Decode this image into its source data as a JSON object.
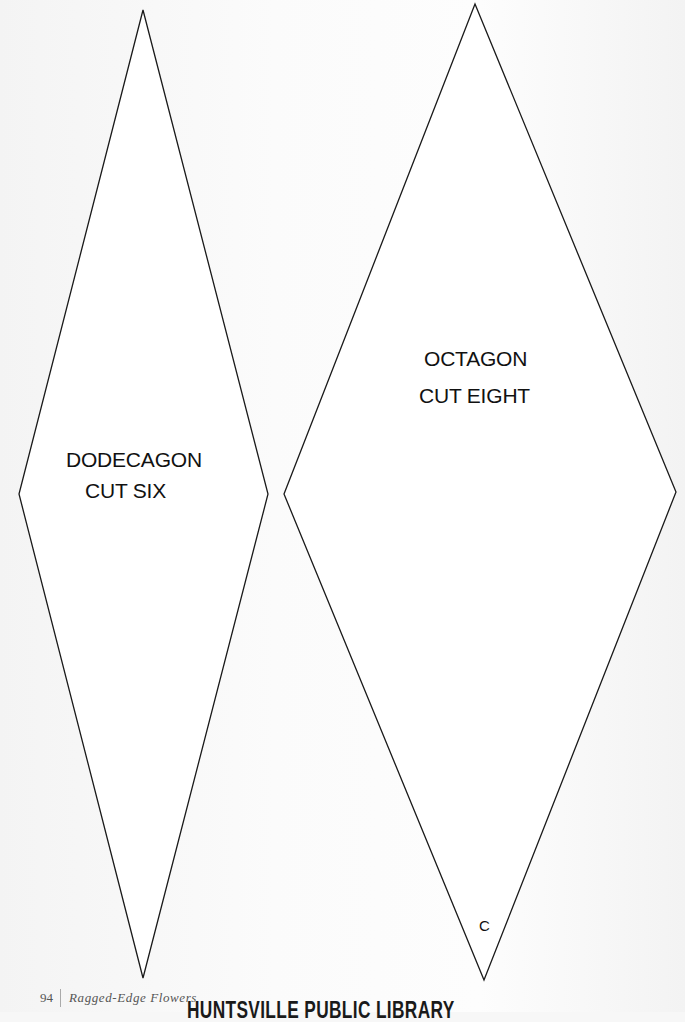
{
  "page": {
    "shapes": [
      {
        "id": "dodecagon",
        "points": {
          "top": [
            143,
            10
          ],
          "right": [
            268,
            494
          ],
          "bottom": [
            143,
            978
          ],
          "left": [
            19,
            494
          ]
        },
        "label_lines": [
          "DODECAGON",
          "CUT SIX"
        ]
      },
      {
        "id": "octagon",
        "points": {
          "top": [
            475,
            4
          ],
          "right": [
            676,
            492
          ],
          "bottom": [
            484,
            980
          ],
          "left": [
            284,
            494
          ]
        },
        "label_lines": [
          "OCTAGON",
          "CUT EIGHT"
        ],
        "corner_mark": "C"
      }
    ],
    "footer": {
      "page_number": "94",
      "book_title": "Ragged-Edge Flowers"
    },
    "stamp": "HUNTSVILLE PUBLIC LIBRARY"
  }
}
